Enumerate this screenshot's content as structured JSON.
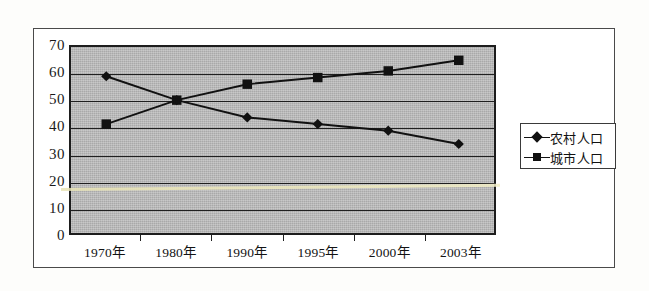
{
  "chart_data": {
    "type": "line",
    "title": "",
    "xlabel": "",
    "ylabel": "",
    "categories": [
      "1970年",
      "1980年",
      "1990年",
      "1995年",
      "2000年",
      "2003年"
    ],
    "series": [
      {
        "name": "农村人口",
        "marker": "diamond",
        "color": "#111111",
        "values": [
          59,
          50,
          43.5,
          41,
          38.5,
          33.5
        ]
      },
      {
        "name": "城市人口",
        "marker": "square",
        "color": "#111111",
        "values": [
          41,
          50,
          56,
          58.5,
          61,
          65
        ]
      }
    ],
    "ylim": [
      0,
      70
    ],
    "yticks": [
      0,
      10,
      20,
      30,
      40,
      50,
      60,
      70
    ],
    "ytick_labels": [
      "0",
      "10",
      "20",
      "30",
      "40",
      "50",
      "60",
      "70"
    ],
    "grid": true,
    "grid_axis": "y",
    "legend_position": "right-outside",
    "plot_background_color": "#a9a9a9",
    "frame_color": "#1d1d1d",
    "page_background_color": "#fdfdfb"
  },
  "legend": {
    "items": [
      {
        "label": "农村人口",
        "marker": "diamond"
      },
      {
        "label": "城市人口",
        "marker": "square"
      }
    ]
  }
}
